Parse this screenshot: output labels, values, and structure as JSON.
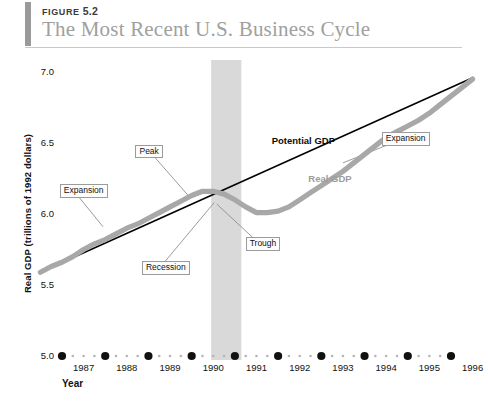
{
  "header": {
    "figure_label": "FIGURE",
    "figure_number": "5.2",
    "title": "The Most Recent U.S. Business Cycle"
  },
  "colors": {
    "real_gdp": "#a8a8a8",
    "potential_gdp": "#000000",
    "recession_band": "#d9d9d9",
    "title_text": "#a0a0a0",
    "header_bar": "#9a9a9a",
    "annotation_border": "#9b9b9b"
  },
  "chart_data": {
    "type": "line",
    "title": "The Most Recent U.S. Business Cycle",
    "xlabel": "Year",
    "ylabel": "Real GDP (trillions of 1992 dollars)",
    "xlim": [
      1986.5,
      1996.5
    ],
    "ylim": [
      5.0,
      7.0
    ],
    "yticks": [
      "5.0",
      "5.5",
      "6.0",
      "6.5",
      "7.0"
    ],
    "ytick_values": [
      5.0,
      5.5,
      6.0,
      6.5,
      7.0
    ],
    "xticks": [
      "1987",
      "1988",
      "1989",
      "1990",
      "1991",
      "1992",
      "1993",
      "1994",
      "1995",
      "1996"
    ],
    "xtick_values": [
      1987,
      1988,
      1989,
      1990,
      1991,
      1992,
      1993,
      1994,
      1995,
      1996
    ],
    "grid": false,
    "legend_position": "inline-annotations",
    "series": [
      {
        "name": "Potential GDP",
        "style": "thin-black-straight",
        "x": [
          1986.5,
          1996.5
        ],
        "values": [
          5.59,
          6.96
        ]
      },
      {
        "name": "Real GDP",
        "style": "thick-gray-wavy",
        "x": [
          1986.5,
          1986.75,
          1987.0,
          1987.25,
          1987.5,
          1987.75,
          1988.0,
          1988.25,
          1988.5,
          1988.75,
          1989.0,
          1989.25,
          1989.5,
          1989.75,
          1990.0,
          1990.25,
          1990.5,
          1990.75,
          1991.0,
          1991.25,
          1991.5,
          1991.75,
          1992.0,
          1992.25,
          1992.5,
          1992.75,
          1993.0,
          1993.25,
          1993.5,
          1993.75,
          1994.0,
          1994.25,
          1994.5,
          1994.75,
          1995.0,
          1995.25,
          1995.5,
          1995.75,
          1996.0,
          1996.25,
          1996.5
        ],
        "values": [
          5.59,
          5.63,
          5.66,
          5.7,
          5.75,
          5.79,
          5.82,
          5.86,
          5.9,
          5.93,
          5.97,
          6.01,
          6.05,
          6.09,
          6.13,
          6.16,
          6.16,
          6.14,
          6.1,
          6.05,
          6.01,
          6.01,
          6.02,
          6.05,
          6.1,
          6.15,
          6.2,
          6.25,
          6.3,
          6.36,
          6.42,
          6.48,
          6.54,
          6.58,
          6.62,
          6.66,
          6.71,
          6.77,
          6.83,
          6.89,
          6.95
        ]
      }
    ],
    "shaded_regions": [
      {
        "name": "recession",
        "x_start": 1990.45,
        "x_end": 1991.15,
        "color": "#d9d9d9"
      }
    ],
    "annotations": [
      {
        "id": "expansion-left",
        "text": "Expansion",
        "style": "box",
        "x": 1986.95,
        "y": 6.16,
        "target_x": 1987.95,
        "target_y": 5.91
      },
      {
        "id": "peak",
        "text": "Peak",
        "style": "box",
        "x": 1988.7,
        "y": 6.44,
        "target_x": 1989.92,
        "target_y": 6.13
      },
      {
        "id": "recession",
        "text": "Recession",
        "style": "box",
        "x": 1988.85,
        "y": 5.62,
        "target_x": 1990.52,
        "target_y": 6.08
      },
      {
        "id": "trough",
        "text": "Trough",
        "style": "box",
        "x": 1991.25,
        "y": 5.79,
        "target_x": 1990.58,
        "target_y": 6.07
      },
      {
        "id": "expansion-right",
        "text": "Expansion",
        "style": "box",
        "x": 1994.4,
        "y": 6.53,
        "target_x": 1993.5,
        "target_y": 6.36
      },
      {
        "id": "potential-gdp",
        "text": "Potential GDP",
        "style": "plain",
        "x": 1991.85,
        "y": 6.51
      },
      {
        "id": "real-gdp",
        "text": "Real GDP",
        "style": "plain",
        "x": 1992.7,
        "y": 6.24
      }
    ]
  }
}
